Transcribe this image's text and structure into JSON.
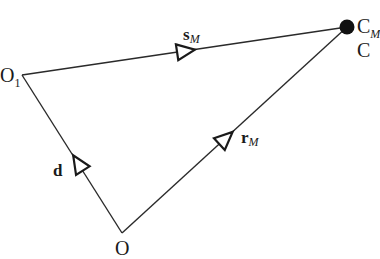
{
  "diagram": {
    "type": "vector-triangle",
    "colors": {
      "line": "#2a2a2a",
      "text": "#1a1a1a",
      "point_fill": "#111111",
      "background": "#ffffff"
    },
    "points": {
      "O1": {
        "label": "O",
        "subscript": "1",
        "x": 22,
        "y": 75
      },
      "C": {
        "label": "C",
        "subscript": "M",
        "alt_label": "C",
        "x": 347,
        "y": 27
      },
      "O": {
        "label": "O",
        "x": 122,
        "y": 233
      }
    },
    "vectors": [
      {
        "name": "s",
        "subscript": "M",
        "from": "O1",
        "to": "C"
      },
      {
        "name": "d",
        "subscript": "",
        "from": "O",
        "to": "O1"
      },
      {
        "name": "r",
        "subscript": "M",
        "from": "O",
        "to": "C"
      }
    ]
  }
}
